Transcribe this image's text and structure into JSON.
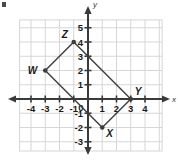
{
  "figure": {
    "background_color": "#ffffff",
    "grid_color": "#d6d6d6",
    "axis_color": "#3a3a3a",
    "shape_color": "#3d3d3d",
    "label_color": "#1a1a1a"
  },
  "corner_mark": {
    "name": "corner-mark",
    "color": "#4a4a4a"
  },
  "axes": {
    "x_name": "x",
    "y_name": "y",
    "x_labels": [
      "-4",
      "-3",
      "-2",
      "-1",
      "0",
      "1",
      "2",
      "3",
      "4"
    ],
    "x_values": [
      -4,
      -3,
      -2,
      -1,
      0,
      1,
      2,
      3,
      4
    ],
    "y_labels": [
      "5",
      "4",
      "3",
      "2",
      "1",
      "-1",
      "-2",
      "-3"
    ],
    "y_values": [
      5,
      4,
      3,
      2,
      1,
      -1,
      -2,
      -3
    ],
    "origin_label": "0",
    "xlim": [
      -4.8,
      4.8
    ],
    "ylim": [
      -3.6,
      5.6
    ],
    "grid": "on"
  },
  "chart_data": {
    "type": "scatter",
    "xlabel": "x",
    "ylabel": "y",
    "xlim": [
      -4.8,
      4.8
    ],
    "ylim": [
      -3.6,
      5.6
    ],
    "grid": true,
    "legend": "none",
    "shape": "quadrilateral",
    "points": [
      {
        "label": "W",
        "x": -3,
        "y": 2,
        "label_pos": "left"
      },
      {
        "label": "Z",
        "x": -1,
        "y": 4,
        "label_pos": "upper-left"
      },
      {
        "label": "Y",
        "x": 3,
        "y": 0,
        "label_pos": "upper-right"
      },
      {
        "label": "X",
        "x": 1,
        "y": -2,
        "label_pos": "lower-right"
      }
    ],
    "edges": [
      [
        "W",
        "Z"
      ],
      [
        "Z",
        "Y"
      ],
      [
        "Y",
        "X"
      ],
      [
        "X",
        "W"
      ]
    ]
  }
}
